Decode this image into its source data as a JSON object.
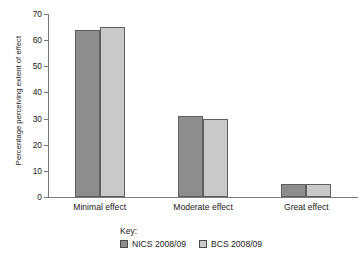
{
  "chart_data": {
    "type": "bar",
    "title": "",
    "xlabel": "",
    "ylabel": "Percentage perceiving extent of effect",
    "categories": [
      "Minimal effect",
      "Moderate effect",
      "Great effect"
    ],
    "series": [
      {
        "name": "NICS 2008/09",
        "values": [
          64,
          31,
          5
        ],
        "color": "#8d8d8d"
      },
      {
        "name": "BCS 2008/09",
        "values": [
          65,
          30,
          5
        ],
        "color": "#c9c9c9"
      }
    ],
    "ylim": [
      0,
      70
    ],
    "yticks": [
      0,
      10,
      20,
      30,
      40,
      50,
      60,
      70
    ],
    "ytick_labels": [
      "0",
      "10",
      "20",
      "30",
      "40",
      "50",
      "60",
      "70"
    ],
    "grid": false,
    "legend_position": "bottom",
    "legend_title": "Key:"
  }
}
